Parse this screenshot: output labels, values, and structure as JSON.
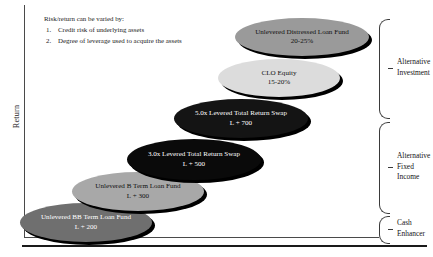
{
  "chart_data": {
    "type": "diagram",
    "title": "",
    "ylabel": "Return",
    "xlabel": "",
    "note": {
      "heading": "Risk/return can be varied by:",
      "items": [
        {
          "num": "1.",
          "text": "Credit risk of underlying assets"
        },
        {
          "num": "2.",
          "text": "Degree of leverage used to acquire the assets"
        }
      ]
    },
    "nodes": [
      {
        "id": "unlevered-bb-term-loan-fund",
        "line1": "Unlevered BB Term Loan Fund",
        "line2": "L + 200",
        "fill": "#6f6f6f",
        "text_color": "#ffffff",
        "x": 20,
        "y": 203,
        "w": 132,
        "h": 39
      },
      {
        "id": "unlevered-b-term-loan-fund",
        "line1": "Unlevered B Term Loan Fund",
        "line2": "L + 300",
        "fill": "#a8a8a8",
        "text_color": "#111111",
        "x": 72,
        "y": 172,
        "w": 132,
        "h": 39
      },
      {
        "id": "three-x-levered-total-return-swap",
        "line1": "3.0x Levered Total Return Swap",
        "line2": "L + 500",
        "fill": "#0a0a0a",
        "text_color": "#ffffff",
        "x": 127,
        "y": 139,
        "w": 134,
        "h": 41
      },
      {
        "id": "five-x-levered-total-return-swap",
        "line1": "5.0x Levered Total Return Swap",
        "line2": "L + 700",
        "fill": "#141414",
        "text_color": "#ffffff",
        "x": 174,
        "y": 99,
        "w": 134,
        "h": 39
      },
      {
        "id": "clo-equity",
        "line1": "CLO Equity",
        "line2": "15-20%",
        "fill": "#dcdcdc",
        "text_color": "#111111",
        "x": 218,
        "y": 59,
        "w": 122,
        "h": 38
      },
      {
        "id": "unlevered-distressed-loan-fund",
        "line1": "Unlevered Distressed Loan Fund",
        "line2": "20-25%",
        "fill": "#9a9a9a",
        "text_color": "#111111",
        "x": 235,
        "y": 18,
        "w": 134,
        "h": 38
      }
    ],
    "categories": [
      {
        "id": "alternative-investment",
        "label_line1": "Alternative",
        "label_line2": "Investment",
        "label_line3": "",
        "x": 379,
        "y": 19,
        "h": 98
      },
      {
        "id": "alternative-fixed-income",
        "label_line1": "Alternative",
        "label_line2": "Fixed",
        "label_line3": "Income",
        "x": 379,
        "y": 122,
        "h": 90
      },
      {
        "id": "cash-enhancer",
        "label_line1": "Cash",
        "label_line2": "Enhancer",
        "label_line3": "",
        "x": 379,
        "y": 216,
        "h": 26
      }
    ]
  }
}
